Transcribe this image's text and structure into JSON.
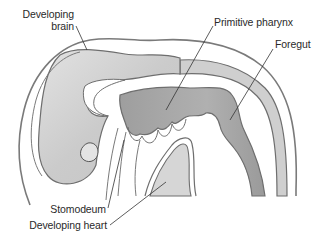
{
  "figure": {
    "colors": {
      "background": "#ffffff",
      "tissue_fill": "#cfcfcf",
      "tissue_highlight": "#e6e6e6",
      "gut_fill": "#a8a8a8",
      "outline": "#6e6e6e",
      "leader_line": "#333333",
      "label_text": "#2a2a2a"
    }
  },
  "labels": {
    "developing_brain_line1": "Developing",
    "developing_brain_line2": "brain",
    "primitive_pharynx": "Primitive pharynx",
    "foregut": "Foregut",
    "stomodeum": "Stomodeum",
    "developing_heart": "Developing heart"
  }
}
